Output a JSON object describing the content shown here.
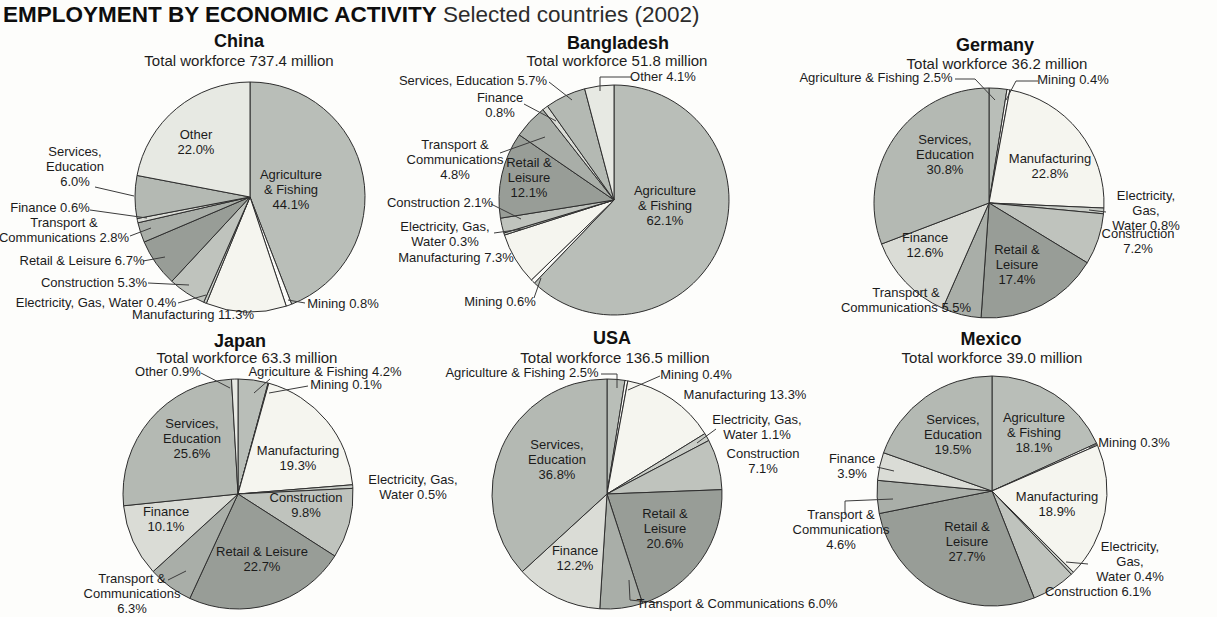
{
  "header": {
    "title_bold": "EMPLOYMENT BY ECONOMIC ACTIVITY",
    "title_sub": " Selected countries (2002)"
  },
  "palette": {
    "agriculture": "#b9beb8",
    "mining": "#fbfbf8",
    "manufacturing": "#f5f5ef",
    "electricity": "#c9cdc7",
    "construction": "#bfc3bd",
    "retail": "#989d97",
    "transport": "#a9aea8",
    "finance": "#dadcd6",
    "services": "#b4b9b3",
    "other": "#e7e9e3"
  },
  "chart_data": [
    {
      "type": "pie",
      "country": "China",
      "title": "China",
      "subtitle": "Total workforce 737.4 million",
      "unit": "percent of workforce",
      "start_angle_deg": 0,
      "direction": "clockwise",
      "categories": [
        "Agriculture & Fishing",
        "Mining",
        "Manufacturing",
        "Electricity, Gas, Water",
        "Construction",
        "Retail & Leisure",
        "Transport & Communications",
        "Finance",
        "Services, Education",
        "Other"
      ],
      "values": [
        44.1,
        0.8,
        11.3,
        0.4,
        5.3,
        6.7,
        2.8,
        0.6,
        6.0,
        22.0
      ],
      "color_keys": [
        "agriculture",
        "mining",
        "manufacturing",
        "electricity",
        "construction",
        "retail",
        "transport",
        "finance",
        "services",
        "other"
      ]
    },
    {
      "type": "pie",
      "country": "Bangladesh",
      "title": "Bangladesh",
      "subtitle": "Total workforce 51.8 million",
      "unit": "percent of workforce",
      "start_angle_deg": 0,
      "direction": "clockwise",
      "categories": [
        "Agriculture & Fishing",
        "Mining",
        "Manufacturing",
        "Electricity, Gas, Water",
        "Construction",
        "Retail & Leisure",
        "Transport & Communications",
        "Finance",
        "Services, Education",
        "Other"
      ],
      "values": [
        62.1,
        0.6,
        7.3,
        0.3,
        2.1,
        12.1,
        4.8,
        0.8,
        5.7,
        4.1
      ],
      "color_keys": [
        "agriculture",
        "mining",
        "manufacturing",
        "electricity",
        "construction",
        "retail",
        "transport",
        "finance",
        "services",
        "other"
      ]
    },
    {
      "type": "pie",
      "country": "Germany",
      "title": "Germany",
      "subtitle": "Total workforce 36.2 million",
      "unit": "percent of workforce",
      "start_angle_deg": 0,
      "direction": "clockwise",
      "categories": [
        "Agriculture & Fishing",
        "Mining",
        "Manufacturing",
        "Electricity, Gas, Water",
        "Construction",
        "Retail & Leisure",
        "Transport & Communications",
        "Finance",
        "Services, Education"
      ],
      "values": [
        2.5,
        0.4,
        22.8,
        0.8,
        7.2,
        17.4,
        5.5,
        12.6,
        30.8
      ],
      "color_keys": [
        "agriculture",
        "mining",
        "manufacturing",
        "electricity",
        "construction",
        "retail",
        "transport",
        "finance",
        "services"
      ]
    },
    {
      "type": "pie",
      "country": "Japan",
      "title": "Japan",
      "subtitle": "Total workforce 63.3 million",
      "unit": "percent of workforce",
      "start_angle_deg": 0,
      "direction": "clockwise",
      "categories": [
        "Agriculture & Fishing",
        "Mining",
        "Manufacturing",
        "Electricity, Gas, Water",
        "Construction",
        "Retail & Leisure",
        "Transport & Communications",
        "Finance",
        "Services, Education",
        "Other"
      ],
      "values": [
        4.2,
        0.1,
        19.3,
        0.5,
        9.8,
        22.7,
        6.3,
        10.1,
        25.6,
        0.9
      ],
      "color_keys": [
        "agriculture",
        "mining",
        "manufacturing",
        "electricity",
        "construction",
        "retail",
        "transport",
        "finance",
        "services",
        "other"
      ]
    },
    {
      "type": "pie",
      "country": "USA",
      "title": "USA",
      "subtitle": "Total workforce 136.5 million",
      "unit": "percent of workforce",
      "start_angle_deg": 0,
      "direction": "clockwise",
      "categories": [
        "Agriculture & Fishing",
        "Mining",
        "Manufacturing",
        "Electricity, Gas, Water",
        "Construction",
        "Retail & Leisure",
        "Transport & Communications",
        "Finance",
        "Services, Education"
      ],
      "values": [
        2.5,
        0.4,
        13.3,
        1.1,
        7.1,
        20.6,
        6.0,
        12.2,
        36.8
      ],
      "color_keys": [
        "agriculture",
        "mining",
        "manufacturing",
        "electricity",
        "construction",
        "retail",
        "transport",
        "finance",
        "services"
      ]
    },
    {
      "type": "pie",
      "country": "Mexico",
      "title": "Mexico",
      "subtitle": "Total workforce 39.0 million",
      "unit": "percent of workforce",
      "start_angle_deg": 0,
      "direction": "clockwise",
      "categories": [
        "Agriculture & Fishing",
        "Mining",
        "Manufacturing",
        "Electricity, Gas, Water",
        "Construction",
        "Retail & Leisure",
        "Transport & Communications",
        "Finance",
        "Services, Education"
      ],
      "values": [
        18.1,
        0.3,
        18.9,
        0.4,
        6.1,
        27.7,
        4.6,
        3.9,
        19.5
      ],
      "color_keys": [
        "agriculture",
        "mining",
        "manufacturing",
        "electricity",
        "construction",
        "retail",
        "transport",
        "finance",
        "services"
      ]
    }
  ],
  "display_labels": {
    "china": [
      "Other\n22.0%",
      "Agriculture\n& Fishing\n44.1%",
      "Services,\nEducation\n6.0%",
      "Finance 0.6%",
      "Transport &\nCommunications 2.8%",
      "Retail & Leisure 6.7%",
      "Construction 5.3%",
      "Electricity, Gas, Water 0.4%",
      "Manufacturing 11.3%",
      "Mining 0.8%"
    ],
    "bangladesh": [
      "Services, Education 5.7%",
      "Finance\n0.8%",
      "Transport &\nCommunications\n4.8%",
      "Retail &\nLeisure\n12.1%",
      "Construction 2.1%",
      "Electricity, Gas,\nWater 0.3%",
      "Manufacturing 7.3%",
      "Mining 0.6%",
      "Other 4.1%",
      "Agriculture\n& Fishing\n62.1%"
    ],
    "germany": [
      "Agriculture & Fishing 2.5%",
      "Mining 0.4%",
      "Services,\nEducation\n30.8%",
      "Manufacturing\n22.8%",
      "Electricity, Gas,\nWater 0.8%",
      "Construction\n7.2%",
      "Retail &\nLeisure\n17.4%",
      "Transport &\nCommunications 5.5%",
      "Finance\n12.6%"
    ],
    "japan": [
      "Other 0.9%",
      "Agriculture & Fishing 4.2%",
      "Mining 0.1%",
      "Services,\nEducation\n25.6%",
      "Manufacturing\n19.3%",
      "Electricity, Gas,\nWater 0.5%",
      "Construction\n9.8%",
      "Retail & Leisure\n22.7%",
      "Finance\n10.1%",
      "Transport &\nCommunications\n6.3%"
    ],
    "usa": [
      "Agriculture & Fishing 2.5%",
      "Mining 0.4%",
      "Manufacturing 13.3%",
      "Electricity, Gas,\nWater 1.1%",
      "Construction\n7.1%",
      "Services,\nEducation\n36.8%",
      "Retail &\nLeisure\n20.6%",
      "Finance\n12.2%",
      "Transport & Communications 6.0%"
    ],
    "mexico": [
      "Services,\nEducation\n19.5%",
      "Agriculture\n& Fishing\n18.1%",
      "Mining 0.3%",
      "Finance\n3.9%",
      "Transport &\nCommunications\n4.6%",
      "Retail &\nLeisure\n27.7%",
      "Manufacturing\n18.9%",
      "Electricity, Gas,\nWater 0.4%",
      "Construction 6.1%"
    ]
  }
}
